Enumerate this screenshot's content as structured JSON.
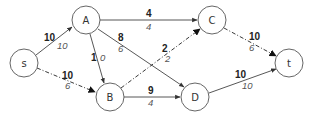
{
  "diagram": {
    "type": "flow-network",
    "nodes": [
      {
        "id": "s",
        "label": "s",
        "x": 24,
        "y": 63
      },
      {
        "id": "A",
        "label": "A",
        "x": 86,
        "y": 20
      },
      {
        "id": "B",
        "label": "B",
        "x": 110,
        "y": 97
      },
      {
        "id": "C",
        "label": "C",
        "x": 212,
        "y": 20
      },
      {
        "id": "D",
        "label": "D",
        "x": 195,
        "y": 97
      },
      {
        "id": "t",
        "label": "t",
        "x": 289,
        "y": 63
      }
    ],
    "edges": [
      {
        "from": "s",
        "to": "A",
        "capacity": "10",
        "flow": "10",
        "style": "solid"
      },
      {
        "from": "s",
        "to": "B",
        "capacity": "10",
        "flow": "6",
        "style": "dashdot"
      },
      {
        "from": "A",
        "to": "C",
        "capacity": "4",
        "flow": "4",
        "style": "solid"
      },
      {
        "from": "A",
        "to": "B",
        "capacity": "1",
        "flow": "0",
        "style": "solid"
      },
      {
        "from": "A",
        "to": "D",
        "capacity": "8",
        "flow": "6",
        "style": "solid"
      },
      {
        "from": "B",
        "to": "C",
        "capacity": "2",
        "flow": "2",
        "style": "dashdot"
      },
      {
        "from": "B",
        "to": "D",
        "capacity": "9",
        "flow": "4",
        "style": "solid"
      },
      {
        "from": "C",
        "to": "t",
        "capacity": "10",
        "flow": "6",
        "style": "dashdot"
      },
      {
        "from": "D",
        "to": "t",
        "capacity": "10",
        "flow": "10",
        "style": "solid"
      }
    ]
  }
}
